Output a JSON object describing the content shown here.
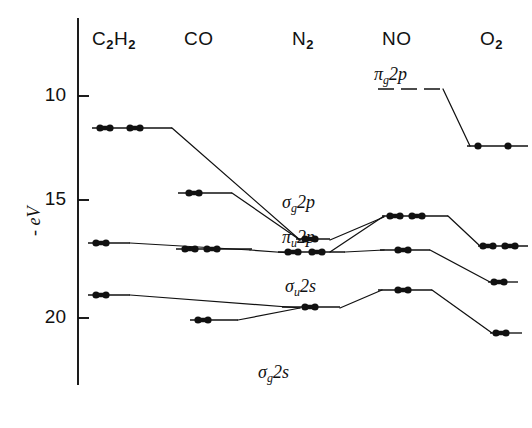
{
  "figure": {
    "kind": "molecular-orbital-correlation-diagram",
    "width": 532,
    "height": 428,
    "background": "#ffffff",
    "ink": "#111111"
  },
  "axis": {
    "title": "- eV",
    "title_parts": {
      "minus": "-",
      "unit": "eV"
    },
    "orientation": "vertical",
    "direction": "increasing-downward",
    "x_px": 78,
    "top_px": 18,
    "bottom_px": 385,
    "ticks": [
      {
        "label": "10",
        "value": 10,
        "y_px": 96
      },
      {
        "label": "15",
        "value": 15,
        "y_px": 200
      },
      {
        "label": "20",
        "value": 20,
        "y_px": 318
      }
    ],
    "tick_length_px": 11
  },
  "columns": [
    {
      "id": "c2h2",
      "label": "C",
      "sub1": "2",
      "label2": "H",
      "sub2": "2",
      "header_x": 92,
      "center_x": 128,
      "span": [
        88,
        172
      ]
    },
    {
      "id": "co",
      "label": "CO",
      "header_x": 184,
      "center_x": 208,
      "span": [
        172,
        250
      ]
    },
    {
      "id": "n2",
      "label": "N",
      "sub1": "2",
      "header_x": 292,
      "center_x": 308,
      "span": [
        250,
        355
      ]
    },
    {
      "id": "no",
      "label": "NO",
      "header_x": 382,
      "center_x": 412,
      "span": [
        355,
        455
      ]
    },
    {
      "id": "o2",
      "label": "O",
      "sub1": "2",
      "header_x": 480,
      "center_x": 490,
      "span": [
        455,
        528
      ]
    }
  ],
  "header_row": {
    "y_px": 28
  },
  "orbital_labels": [
    {
      "id": "pi-g-2p",
      "greek": "π",
      "sub": "g",
      "text": "2p",
      "x": 374,
      "y": 64,
      "note": "labels the NO pi-g 2p level"
    },
    {
      "id": "sigma-g-2p",
      "greek": "σ",
      "sub": "g",
      "text": "2p",
      "x": 282,
      "y": 192,
      "note": "labels the N2 sigma-g 2p level"
    },
    {
      "id": "pi-u-2p",
      "greek": "π",
      "sub": "u",
      "text": "2p",
      "x": 282,
      "y": 227,
      "note": "labels the N2 pi-u 2p level"
    },
    {
      "id": "sigma-u-2s",
      "greek": "σ",
      "sub": "u",
      "text": "2s",
      "x": 285,
      "y": 276,
      "note": "labels the N2 sigma-u 2s level"
    },
    {
      "id": "sigma-g-2s",
      "greek": "σ",
      "sub": "g",
      "text": "2s",
      "x": 258,
      "y": 362,
      "note": "caption for the lowest (off-scale) level"
    }
  ],
  "levels": [
    {
      "id": "c2h2-pi-u-2p",
      "column": "c2h2",
      "x1": 92,
      "x2": 172,
      "y": 128,
      "ev": 11.4,
      "electrons": 4,
      "dot_mode": "pairs",
      "dot_groups": [
        [
          100,
          110
        ],
        [
          130,
          140
        ]
      ]
    },
    {
      "id": "c2h2-sigma-g-2p",
      "column": "c2h2",
      "x1": 88,
      "x2": 130,
      "y": 243,
      "ev": 16.4,
      "electrons": 2,
      "dot_mode": "pairs",
      "dot_groups": [
        [
          96,
          106
        ]
      ]
    },
    {
      "id": "c2h2-sigma-u-2s",
      "column": "c2h2",
      "x1": 88,
      "x2": 130,
      "y": 295,
      "ev": 18.4,
      "electrons": 2,
      "dot_mode": "pairs",
      "dot_groups": [
        [
          96,
          106
        ]
      ]
    },
    {
      "id": "co-sigma-2p",
      "column": "co",
      "x1": 178,
      "x2": 232,
      "y": 193,
      "ev": 14.0,
      "electrons": 2,
      "dot_mode": "pairs",
      "dot_groups": [
        [
          189,
          199
        ]
      ]
    },
    {
      "id": "co-pi-2p",
      "column": "co",
      "x1": 176,
      "x2": 252,
      "y": 249,
      "ev": 16.6,
      "electrons": 4,
      "dot_mode": "pairs",
      "dot_groups": [
        [
          185,
          195
        ],
        [
          207,
          217
        ]
      ]
    },
    {
      "id": "co-sigma-2s",
      "column": "co",
      "x1": 190,
      "x2": 238,
      "y": 320,
      "ev": 19.7,
      "electrons": 2,
      "dot_mode": "pairs",
      "dot_groups": [
        [
          198,
          208
        ]
      ]
    },
    {
      "id": "n2-sigma-g-2p",
      "column": "n2",
      "x1": 296,
      "x2": 330,
      "y": 239,
      "ev": 15.6,
      "electrons": 2,
      "dot_mode": "pairs",
      "dot_groups": [
        [
          305,
          315
        ]
      ]
    },
    {
      "id": "n2-pi-u-2p",
      "column": "n2",
      "x1": 278,
      "x2": 345,
      "y": 252,
      "ev": 16.7,
      "electrons": 4,
      "dot_mode": "pairs",
      "dot_groups": [
        [
          288,
          298
        ],
        [
          312,
          322
        ]
      ]
    },
    {
      "id": "n2-sigma-u-2s",
      "column": "n2",
      "x1": 282,
      "x2": 340,
      "y": 307,
      "ev": 18.8,
      "electrons": 2,
      "dot_mode": "pairs",
      "dot_groups": [
        [
          305,
          315
        ]
      ]
    },
    {
      "id": "no-pi-g-2p",
      "column": "no",
      "x1": 378,
      "x2": 443,
      "y": 89,
      "ev": 9.3,
      "electrons": 0,
      "dot_mode": "none",
      "dot_groups": [],
      "style": "dashed"
    },
    {
      "id": "no-pi-2p",
      "column": "no",
      "x1": 382,
      "x2": 448,
      "y": 216,
      "ev": 14.8,
      "electrons": 4,
      "dot_mode": "pairs",
      "dot_groups": [
        [
          390,
          400
        ],
        [
          412,
          422
        ]
      ]
    },
    {
      "id": "no-sigma-2p",
      "column": "no",
      "x1": 380,
      "x2": 430,
      "y": 250,
      "ev": 16.6,
      "electrons": 2,
      "dot_mode": "pairs",
      "dot_groups": [
        [
          398,
          408
        ]
      ]
    },
    {
      "id": "no-sigma-2s",
      "column": "no",
      "x1": 378,
      "x2": 432,
      "y": 290,
      "ev": 18.3,
      "electrons": 2,
      "dot_mode": "pairs",
      "dot_groups": [
        [
          398,
          408
        ]
      ]
    },
    {
      "id": "o2-pi-g-2p",
      "column": "o2",
      "x1": 467,
      "x2": 528,
      "y": 146,
      "ev": 12.2,
      "electrons": 2,
      "dot_mode": "singles",
      "dot_groups": [
        [
          478
        ],
        [
          508
        ]
      ]
    },
    {
      "id": "o2-pi-u-2p",
      "column": "o2",
      "x1": 478,
      "x2": 528,
      "y": 246,
      "ev": 16.2,
      "electrons": 4,
      "dot_mode": "pairs",
      "dot_groups": [
        [
          483,
          493
        ],
        [
          505,
          515
        ]
      ]
    },
    {
      "id": "o2-sigma-g-2p",
      "column": "o2",
      "x1": 488,
      "x2": 518,
      "y": 282,
      "ev": 17.5,
      "electrons": 2,
      "dot_mode": "pairs",
      "dot_groups": [
        [
          494,
          504
        ]
      ]
    },
    {
      "id": "o2-sigma-u-2s",
      "column": "o2",
      "x1": 490,
      "x2": 522,
      "y": 333,
      "ev": 20.3,
      "electrons": 2,
      "dot_mode": "pairs",
      "dot_groups": [
        [
          496,
          506
        ]
      ]
    }
  ],
  "correlation_lines": [
    {
      "id": "link-c2h2-pi-to-n2-sigma",
      "points": [
        [
          172,
          128
        ],
        [
          300,
          240
        ]
      ]
    },
    {
      "id": "link-co-sigma2p-to-n2-sigma",
      "points": [
        [
          232,
          193
        ],
        [
          300,
          240
        ]
      ]
    },
    {
      "id": "link-n2-sigma-to-no-pi",
      "points": [
        [
          330,
          240
        ],
        [
          384,
          217
        ]
      ]
    },
    {
      "id": "link-c2h2-sg-to-co-pi",
      "points": [
        [
          130,
          243
        ],
        [
          250,
          250
        ]
      ]
    },
    {
      "id": "link-co-pi-to-n2-pi",
      "points": [
        [
          250,
          250
        ],
        [
          290,
          253
        ]
      ]
    },
    {
      "id": "link-n2-pi-to-no-sigma",
      "points": [
        [
          345,
          252
        ],
        [
          384,
          250
        ]
      ]
    },
    {
      "id": "link-n2-pi-up-to-no-pi",
      "points": [
        [
          330,
          252
        ],
        [
          384,
          216
        ]
      ]
    },
    {
      "id": "link-no-pi-to-o2-pi-u",
      "points": [
        [
          448,
          216
        ],
        [
          480,
          246
        ]
      ]
    },
    {
      "id": "link-no-sigma2p-to-o2-sigma-g",
      "points": [
        [
          430,
          250
        ],
        [
          490,
          282
        ]
      ]
    },
    {
      "id": "link-c2h2-su-to-n2-su",
      "points": [
        [
          130,
          295
        ],
        [
          300,
          308
        ]
      ]
    },
    {
      "id": "link-co-s2s-to-n2-su",
      "points": [
        [
          238,
          320
        ],
        [
          300,
          308
        ]
      ]
    },
    {
      "id": "link-n2-su-to-no-s2s",
      "points": [
        [
          340,
          308
        ],
        [
          382,
          290
        ]
      ]
    },
    {
      "id": "link-no-s2s-to-o2-su",
      "points": [
        [
          432,
          290
        ],
        [
          492,
          333
        ]
      ]
    },
    {
      "id": "link-no-pig-to-o2-pig",
      "points": [
        [
          443,
          89
        ],
        [
          470,
          146
        ]
      ]
    }
  ],
  "dots": {
    "radius_px": 3.6,
    "color": "#111111"
  }
}
